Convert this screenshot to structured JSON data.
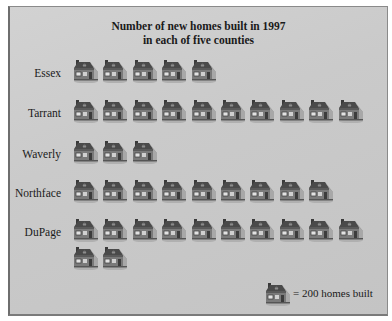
{
  "chart_data": {
    "type": "pictograph",
    "title": "Number of new homes built in 1997",
    "subtitle": "in each of five counties",
    "categories": [
      "Essex",
      "Tarrant",
      "Waverly",
      "Northface",
      "DuPage"
    ],
    "icon_counts": [
      5,
      10,
      3,
      9,
      12
    ],
    "values": [
      1000,
      2000,
      600,
      1800,
      2400
    ],
    "icon": "house-icon",
    "icon_value": 200,
    "legend": "= 200 homes built",
    "xlabel": "",
    "ylabel": ""
  },
  "title_line1": "Number of new homes built in 1997",
  "title_line2": "in each of five counties",
  "rows": [
    {
      "label": "Essex",
      "count": 5
    },
    {
      "label": "Tarrant",
      "count": 10
    },
    {
      "label": "Waverly",
      "count": 3
    },
    {
      "label": "Northface",
      "count": 9
    },
    {
      "label": "DuPage",
      "count": 12
    }
  ],
  "legend_text": "= 200 homes built"
}
